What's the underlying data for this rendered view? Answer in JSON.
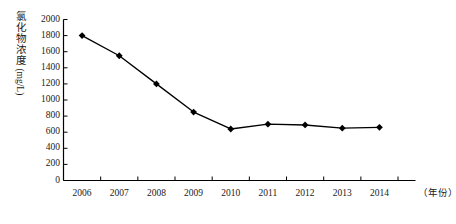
{
  "chart_data": {
    "type": "line",
    "title": "",
    "xlabel": "（年份）",
    "ylabel": "氯化物浓度(mg/L)",
    "ylabel_cjk": "氯化物浓度",
    "ylabel_unit": "(mg/L)",
    "categories": [
      "2006",
      "2007",
      "2008",
      "2009",
      "2010",
      "2011",
      "2012",
      "2013",
      "2014"
    ],
    "values": [
      1800,
      1550,
      1200,
      850,
      640,
      700,
      690,
      650,
      660
    ],
    "ylim": [
      0,
      2000
    ],
    "yticks": [
      0,
      200,
      400,
      600,
      800,
      1000,
      1200,
      1400,
      1600,
      1800,
      2000
    ],
    "ytick_labels": [
      "0",
      "200",
      "400",
      "600",
      "800",
      "1000",
      "1200",
      "1400",
      "1600",
      "1800",
      "2000"
    ],
    "grid": false,
    "legend": false,
    "marker": "diamond",
    "line_color": "#000000",
    "marker_color": "#000000",
    "axis_color": "#000000"
  }
}
